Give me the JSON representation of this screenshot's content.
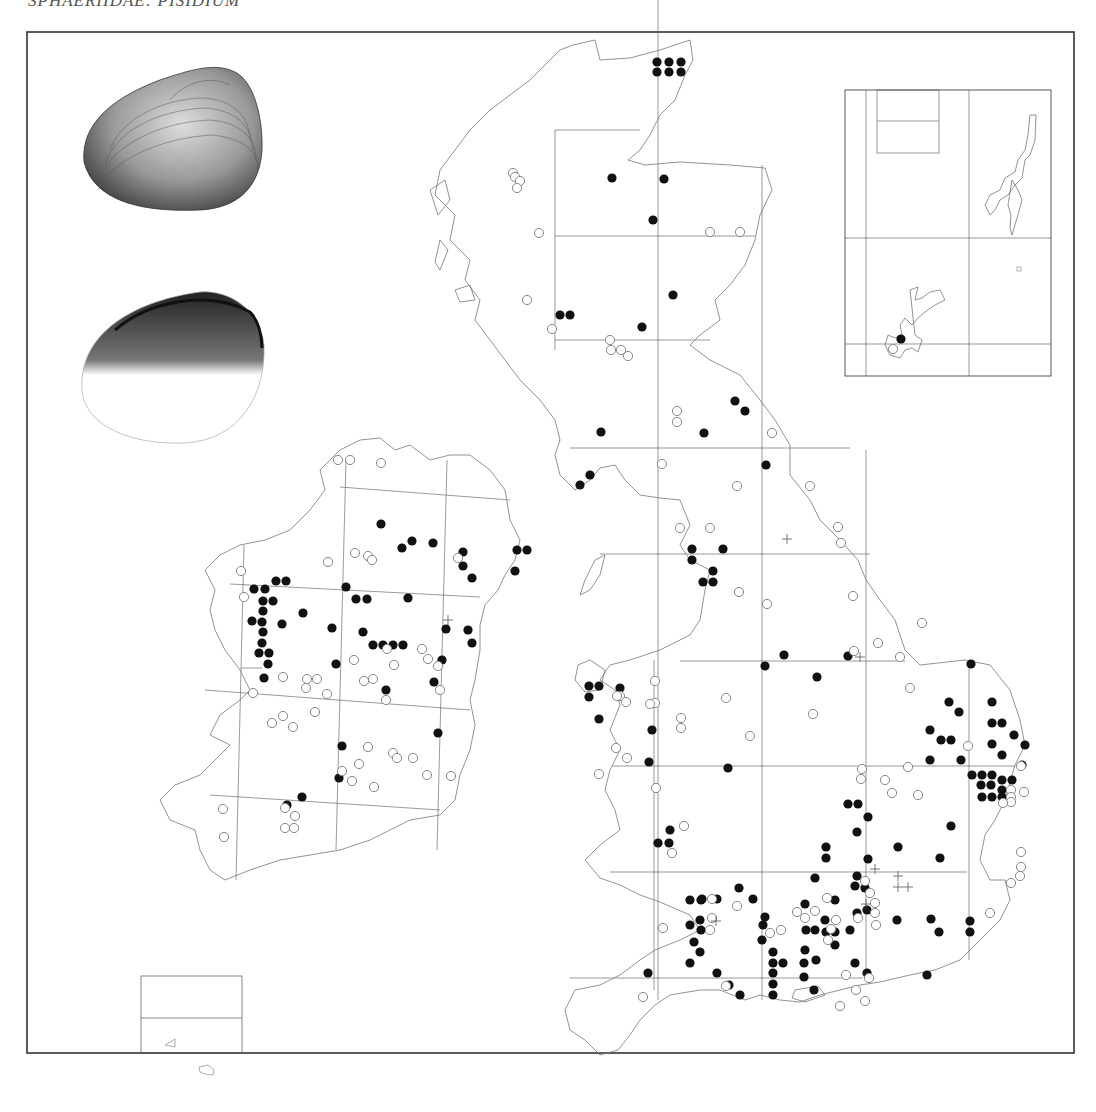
{
  "page": {
    "title": "SPHAERIIDAE: PISIDIUM"
  },
  "map": {
    "frame": {
      "x": 27,
      "y": 32,
      "w": 1047,
      "h": 1021
    },
    "colors": {
      "coast": "#777777",
      "grid": "#555555",
      "frame": "#333333",
      "record_filled": "#111111",
      "record_open": "#888888"
    },
    "legend_symbols": {
      "filled-dot": "recent record",
      "open-circle": "older record",
      "plus": "unlocalised record"
    },
    "filled": [
      [
        657,
        9
      ],
      [
        669,
        9
      ],
      [
        681,
        9
      ],
      [
        657,
        19
      ],
      [
        669,
        19
      ],
      [
        681,
        19
      ],
      [
        612,
        178
      ],
      [
        664,
        179
      ],
      [
        653,
        220
      ],
      [
        673,
        295
      ],
      [
        642,
        327
      ],
      [
        560,
        315
      ],
      [
        570,
        315
      ],
      [
        601,
        432
      ],
      [
        735,
        401
      ],
      [
        745,
        411
      ],
      [
        704,
        433
      ],
      [
        766,
        465
      ],
      [
        590,
        475
      ],
      [
        580,
        485
      ],
      [
        692,
        549
      ],
      [
        723,
        549
      ],
      [
        692,
        560
      ],
      [
        713,
        571
      ],
      [
        703,
        582
      ],
      [
        713,
        582
      ],
      [
        381,
        524
      ],
      [
        412,
        541
      ],
      [
        433,
        543
      ],
      [
        402,
        548
      ],
      [
        463,
        552
      ],
      [
        463,
        566
      ],
      [
        517,
        550
      ],
      [
        527,
        550
      ],
      [
        515,
        571
      ],
      [
        472,
        578
      ],
      [
        276,
        581
      ],
      [
        286,
        581
      ],
      [
        346,
        587
      ],
      [
        254,
        589
      ],
      [
        265,
        589
      ],
      [
        356,
        599
      ],
      [
        367,
        599
      ],
      [
        263,
        601
      ],
      [
        273,
        601
      ],
      [
        408,
        598
      ],
      [
        263,
        611
      ],
      [
        303,
        613
      ],
      [
        262,
        622
      ],
      [
        252,
        621
      ],
      [
        282,
        624
      ],
      [
        332,
        628
      ],
      [
        446,
        629
      ],
      [
        468,
        630
      ],
      [
        263,
        632
      ],
      [
        363,
        632
      ],
      [
        262,
        643
      ],
      [
        373,
        645
      ],
      [
        383,
        645
      ],
      [
        393,
        645
      ],
      [
        403,
        645
      ],
      [
        472,
        643
      ],
      [
        259,
        653
      ],
      [
        269,
        653
      ],
      [
        268,
        664
      ],
      [
        442,
        660
      ],
      [
        434,
        682
      ],
      [
        264,
        678
      ],
      [
        336,
        664
      ],
      [
        386,
        690
      ],
      [
        342,
        746
      ],
      [
        302,
        797
      ],
      [
        438,
        733
      ],
      [
        339,
        778
      ],
      [
        287,
        805
      ],
      [
        620,
        688
      ],
      [
        589,
        686
      ],
      [
        599,
        686
      ],
      [
        589,
        697
      ],
      [
        599,
        719
      ],
      [
        848,
        656
      ],
      [
        817,
        677
      ],
      [
        765,
        666
      ],
      [
        784,
        655
      ],
      [
        652,
        730
      ],
      [
        649,
        762
      ],
      [
        728,
        768
      ],
      [
        670,
        830
      ],
      [
        658,
        843
      ],
      [
        669,
        843
      ],
      [
        971,
        664
      ],
      [
        949,
        702
      ],
      [
        959,
        712
      ],
      [
        992,
        702
      ],
      [
        992,
        723
      ],
      [
        1002,
        723
      ],
      [
        1014,
        735
      ],
      [
        1025,
        745
      ],
      [
        930,
        730
      ],
      [
        941,
        740
      ],
      [
        951,
        740
      ],
      [
        930,
        760
      ],
      [
        961,
        760
      ],
      [
        992,
        744
      ],
      [
        972,
        775
      ],
      [
        982,
        775
      ],
      [
        992,
        775
      ],
      [
        1002,
        755
      ],
      [
        1002,
        780
      ],
      [
        1012,
        780
      ],
      [
        1022,
        765
      ],
      [
        981,
        785
      ],
      [
        991,
        785
      ],
      [
        1002,
        790
      ],
      [
        982,
        797
      ],
      [
        992,
        797
      ],
      [
        1002,
        797
      ],
      [
        951,
        826
      ],
      [
        848,
        804
      ],
      [
        858,
        804
      ],
      [
        868,
        817
      ],
      [
        857,
        832
      ],
      [
        826,
        847
      ],
      [
        826,
        858
      ],
      [
        898,
        847
      ],
      [
        940,
        858
      ],
      [
        868,
        859
      ],
      [
        857,
        876
      ],
      [
        865,
        888
      ],
      [
        815,
        878
      ],
      [
        739,
        888
      ],
      [
        717,
        899
      ],
      [
        702,
        899
      ],
      [
        753,
        899
      ],
      [
        765,
        917
      ],
      [
        855,
        886
      ],
      [
        805,
        904
      ],
      [
        835,
        900
      ],
      [
        825,
        920
      ],
      [
        857,
        913
      ],
      [
        850,
        930
      ],
      [
        835,
        932
      ],
      [
        835,
        945
      ],
      [
        826,
        932
      ],
      [
        815,
        930
      ],
      [
        762,
        940
      ],
      [
        701,
        900
      ],
      [
        690,
        900
      ],
      [
        700,
        920
      ],
      [
        690,
        925
      ],
      [
        701,
        930
      ],
      [
        694,
        942
      ],
      [
        700,
        952
      ],
      [
        690,
        963
      ],
      [
        763,
        925
      ],
      [
        773,
        952
      ],
      [
        773,
        963
      ],
      [
        773,
        973
      ],
      [
        783,
        963
      ],
      [
        773,
        984
      ],
      [
        773,
        995
      ],
      [
        804,
        963
      ],
      [
        804,
        977
      ],
      [
        814,
        990
      ],
      [
        805,
        950
      ],
      [
        816,
        960
      ],
      [
        806,
        930
      ],
      [
        855,
        963
      ],
      [
        867,
        973
      ],
      [
        867,
        910
      ],
      [
        897,
        920
      ],
      [
        927,
        975
      ],
      [
        931,
        919
      ],
      [
        970,
        921
      ],
      [
        970,
        932
      ],
      [
        939,
        932
      ],
      [
        648,
        973
      ],
      [
        729,
        985
      ],
      [
        740,
        995
      ],
      [
        717,
        973
      ]
    ],
    "open": [
      [
        513,
        173
      ],
      [
        515,
        177
      ],
      [
        520,
        181
      ],
      [
        517,
        188
      ],
      [
        539,
        233
      ],
      [
        527,
        300
      ],
      [
        710,
        232
      ],
      [
        740,
        232
      ],
      [
        552,
        329
      ],
      [
        610,
        340
      ],
      [
        611,
        350
      ],
      [
        621,
        350
      ],
      [
        628,
        356
      ],
      [
        677,
        411
      ],
      [
        677,
        422
      ],
      [
        772,
        433
      ],
      [
        662,
        464
      ],
      [
        737,
        486
      ],
      [
        810,
        486
      ],
      [
        680,
        528
      ],
      [
        838,
        527
      ],
      [
        710,
        528
      ],
      [
        841,
        543
      ],
      [
        878,
        643
      ],
      [
        739,
        592
      ],
      [
        767,
        604
      ],
      [
        853,
        596
      ],
      [
        900,
        657
      ],
      [
        922,
        623
      ],
      [
        910,
        688
      ],
      [
        854,
        651
      ],
      [
        338,
        460
      ],
      [
        350,
        460
      ],
      [
        381,
        463
      ],
      [
        355,
        553
      ],
      [
        368,
        556
      ],
      [
        458,
        558
      ],
      [
        372,
        560
      ],
      [
        328,
        562
      ],
      [
        422,
        649
      ],
      [
        387,
        649
      ],
      [
        244,
        597
      ],
      [
        241,
        571
      ],
      [
        428,
        659
      ],
      [
        354,
        660
      ],
      [
        438,
        666
      ],
      [
        394,
        665
      ],
      [
        364,
        681
      ],
      [
        373,
        679
      ],
      [
        440,
        690
      ],
      [
        386,
        700
      ],
      [
        283,
        677
      ],
      [
        307,
        679
      ],
      [
        317,
        679
      ],
      [
        306,
        688
      ],
      [
        327,
        694
      ],
      [
        253,
        693
      ],
      [
        283,
        716
      ],
      [
        272,
        723
      ],
      [
        293,
        727
      ],
      [
        315,
        712
      ],
      [
        368,
        747
      ],
      [
        393,
        753
      ],
      [
        397,
        758
      ],
      [
        413,
        758
      ],
      [
        427,
        775
      ],
      [
        342,
        771
      ],
      [
        352,
        781
      ],
      [
        359,
        764
      ],
      [
        374,
        787
      ],
      [
        451,
        776
      ],
      [
        285,
        808
      ],
      [
        295,
        816
      ],
      [
        223,
        809
      ],
      [
        224,
        837
      ],
      [
        285,
        828
      ],
      [
        294,
        828
      ],
      [
        616,
        748
      ],
      [
        627,
        758
      ],
      [
        599,
        774
      ],
      [
        655,
        681
      ],
      [
        620,
        696
      ],
      [
        655,
        703
      ],
      [
        650,
        704
      ],
      [
        617,
        696
      ],
      [
        626,
        702
      ],
      [
        726,
        698
      ],
      [
        813,
        714
      ],
      [
        681,
        718
      ],
      [
        681,
        728
      ],
      [
        684,
        826
      ],
      [
        672,
        853
      ],
      [
        656,
        788
      ],
      [
        750,
        736
      ],
      [
        862,
        769
      ],
      [
        861,
        779
      ],
      [
        885,
        780
      ],
      [
        908,
        767
      ],
      [
        892,
        793
      ],
      [
        918,
        795
      ],
      [
        865,
        881
      ],
      [
        870,
        893
      ],
      [
        875,
        903
      ],
      [
        875,
        913
      ],
      [
        876,
        925
      ],
      [
        858,
        918
      ],
      [
        827,
        898
      ],
      [
        815,
        911
      ],
      [
        836,
        920
      ],
      [
        831,
        929
      ],
      [
        828,
        940
      ],
      [
        797,
        912
      ],
      [
        805,
        918
      ],
      [
        770,
        933
      ],
      [
        712,
        899
      ],
      [
        712,
        918
      ],
      [
        710,
        930
      ],
      [
        737,
        906
      ],
      [
        781,
        930
      ],
      [
        663,
        928
      ],
      [
        726,
        986
      ],
      [
        846,
        975
      ],
      [
        643,
        997
      ],
      [
        990,
        913
      ],
      [
        1011,
        883
      ],
      [
        1021,
        852
      ],
      [
        1020,
        876
      ],
      [
        1021,
        867
      ],
      [
        1011,
        790
      ],
      [
        1011,
        797
      ],
      [
        1011,
        802
      ],
      [
        1003,
        803
      ],
      [
        968,
        746
      ],
      [
        1021,
        766
      ],
      [
        1024,
        792
      ],
      [
        865,
        1001
      ],
      [
        840,
        1006
      ],
      [
        869,
        978
      ],
      [
        856,
        990
      ]
    ],
    "plus": [
      [
        787,
        539
      ],
      [
        860,
        657
      ],
      [
        448,
        620
      ],
      [
        875,
        869
      ],
      [
        898,
        887
      ],
      [
        908,
        887
      ],
      [
        898,
        876
      ],
      [
        866,
        904
      ],
      [
        716,
        921
      ]
    ]
  },
  "inset_north": {
    "label": "Shetland & Orkney inset",
    "filled": [
      [
        901,
        339
      ]
    ],
    "open": [
      [
        893,
        349
      ]
    ]
  },
  "inset_channel": {
    "label": "Channel Islands inset"
  },
  "illustrations": {
    "shell_exterior": "shell-exterior-drawing",
    "shell_interior": "shell-interior-drawing"
  }
}
